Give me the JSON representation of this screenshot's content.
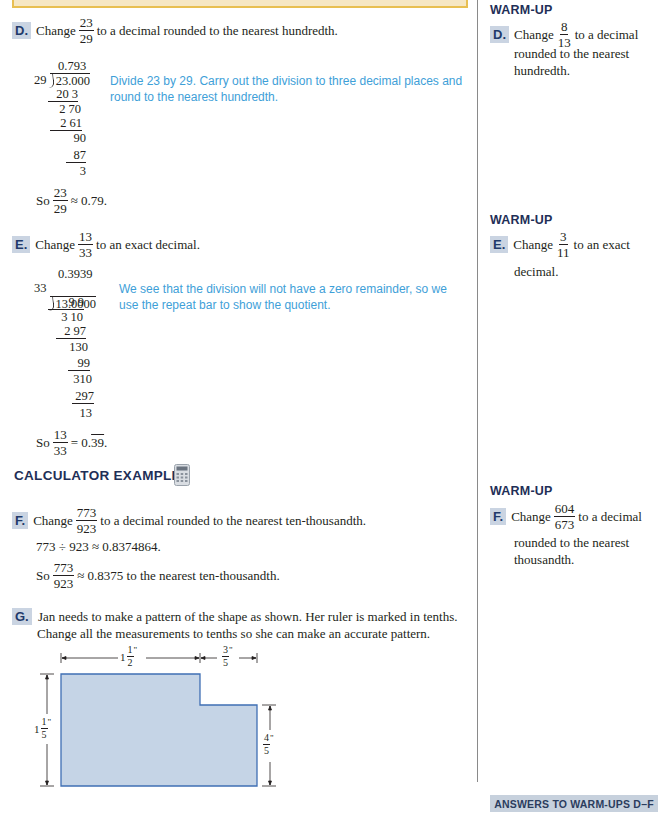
{
  "examples": {
    "D": {
      "letter": "D.",
      "prefix": "Change",
      "frac_num": "23",
      "frac_den": "29",
      "suffix": "to a decimal rounded to the nearest hundredth.",
      "division": {
        "quotient": "0.793",
        "divisor": "29",
        "dividend": "23.000",
        "steps": [
          "20 3",
          "2 70",
          "2 61",
          "90",
          "87",
          "3"
        ]
      },
      "note": "Divide 23 by 29. Carry out the division to three decimal places and round to the nearest hundredth.",
      "result_prefix": "So",
      "result_num": "23",
      "result_den": "29",
      "result_suffix": "≈ 0.79."
    },
    "E": {
      "letter": "E.",
      "prefix": "Change",
      "frac_num": "13",
      "frac_den": "33",
      "suffix": "to an exact decimal.",
      "division": {
        "quotient": "0.3939",
        "divisor": "33",
        "dividend": "13.0000",
        "steps": [
          "9 9",
          "3 10",
          "2 97",
          "130",
          "99",
          "310",
          "297",
          "13"
        ]
      },
      "note": "We see that the division will not have a zero remainder, so we use the repeat bar to show the quotient.",
      "result_prefix": "So",
      "result_num": "13",
      "result_den": "33",
      "result_eq": "= 0.",
      "result_repeat": "39",
      "result_end": "."
    },
    "calculator_heading": "CALCULATOR EXAMPLE:",
    "calculator_icon": "calculator-icon",
    "F": {
      "letter": "F.",
      "prefix": "Change",
      "frac_num": "773",
      "frac_den": "923",
      "suffix": "to a decimal rounded to the nearest ten-thousandth.",
      "calc_line": "773 ÷ 923 ≈ 0.8374864.",
      "result_prefix": "So",
      "result_num": "773",
      "result_den": "923",
      "result_suffix": "≈ 0.8375 to the nearest ten-thousandth."
    },
    "G": {
      "letter": "G.",
      "line1": "Jan needs to make a pattern of the shape as shown. Her ruler is marked in tenths.",
      "line2": "Change all the measurements to tenths so she can make an accurate pattern.",
      "figure": {
        "fill": "#c5d4e6",
        "stroke": "#3f6fb4",
        "top_left_whole": "1",
        "top_left_num": "1",
        "top_left_den": "2",
        "top_right_num": "3",
        "top_right_den": "5",
        "left_whole": "1",
        "left_num": "1",
        "left_den": "5",
        "right_num": "4",
        "right_den": "5",
        "inch_mark": "\""
      }
    }
  },
  "warmups": {
    "D": {
      "title": "WARM-UP",
      "letter": "D.",
      "prefix": "Change",
      "frac_num": "8",
      "frac_den": "13",
      "suffix": "to a decimal",
      "line2": "rounded to the nearest",
      "line3": "hundredth."
    },
    "E": {
      "title": "WARM-UP",
      "letter": "E.",
      "prefix": "Change",
      "frac_num": "3",
      "frac_den": "11",
      "suffix": "to an exact",
      "line2": "decimal."
    },
    "F": {
      "title": "WARM-UP",
      "letter": "F.",
      "prefix": "Change",
      "frac_num": "604",
      "frac_den": "673",
      "suffix": "to a decimal",
      "line2": "rounded to the nearest",
      "line3": "thousandth."
    }
  },
  "footer": {
    "answers_label": "ANSWERS TO WARM-UPS D–F"
  },
  "colors": {
    "badge_bg": "#cad4e2",
    "heading": "#1f2f57",
    "note_blue": "#3ea0d8",
    "top_box_fill": "#f6e7c4",
    "top_box_border": "#e8bf52"
  }
}
